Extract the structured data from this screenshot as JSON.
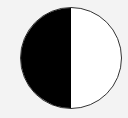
{
  "icon": {
    "name": "half-filled-circle",
    "dark_color": "#000000",
    "light_color": "#ffffff",
    "border_color": "#333333",
    "background": "#f3f3f3"
  }
}
